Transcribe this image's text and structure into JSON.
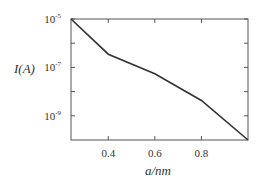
{
  "chart_data": {
    "type": "line",
    "title": "",
    "xlabel": "a/nm",
    "ylabel": "I(A)",
    "xscale": "linear",
    "yscale": "log",
    "xlim": [
      0.24,
      1.0
    ],
    "ylim": [
      1e-10,
      1e-05
    ],
    "x_ticks": [
      0.4,
      0.6,
      0.8
    ],
    "x_tick_labels": [
      "0.4",
      "0.6",
      "0.8"
    ],
    "y_ticks": [
      1e-05,
      1e-07,
      1e-09
    ],
    "y_tick_labels": [
      {
        "base": "10",
        "exp": "-5"
      },
      {
        "base": "10",
        "exp": "-7"
      },
      {
        "base": "10",
        "exp": "-9"
      }
    ],
    "y_minor_ticks": [
      1e-06,
      1e-08
    ],
    "grid": false,
    "legend": null,
    "series": [
      {
        "name": "I(a)",
        "x": [
          0.24,
          0.4,
          0.6,
          0.8,
          1.0
        ],
        "y": [
          1e-05,
          3.5e-07,
          5.5e-08,
          4.3e-09,
          1e-10
        ],
        "color": "#333333"
      }
    ]
  },
  "colors": {
    "axis": "#555555",
    "line": "#333333",
    "text": "#333333"
  }
}
